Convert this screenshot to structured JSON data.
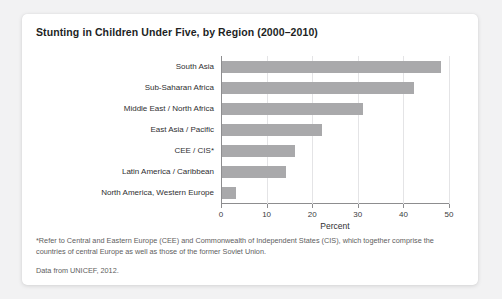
{
  "card": {
    "title": "Stunting in Children Under Five, by Region (2000–2010)",
    "footnote": "*Refer to Central and Eastern Europe (CEE) and Commonwealth of Independent States (CIS), which together comprise the countries of central Europe as well as those of the former Soviet Union.",
    "source": "Data from UNICEF, 2012."
  },
  "chart_data": {
    "type": "bar",
    "orientation": "horizontal",
    "title": "Stunting in Children Under Five, by Region (2000–2010)",
    "xlabel": "Percent",
    "ylabel": "",
    "categories": [
      "South Asia",
      "Sub-Saharan Africa",
      "Middle East / North Africa",
      "East Asia / Pacific",
      "CEE / CIS*",
      "Latin America / Caribbean",
      "North America, Western Europe"
    ],
    "values": [
      48,
      42,
      31,
      22,
      16,
      14,
      3
    ],
    "xlim": [
      0,
      50
    ],
    "xticks": [
      0,
      10,
      20,
      30,
      40,
      50
    ],
    "xtick_labels": [
      "0",
      "10",
      "20",
      "30",
      "40",
      "50"
    ],
    "grid": true,
    "legend": false,
    "bar_color": "#a9a9ab"
  }
}
